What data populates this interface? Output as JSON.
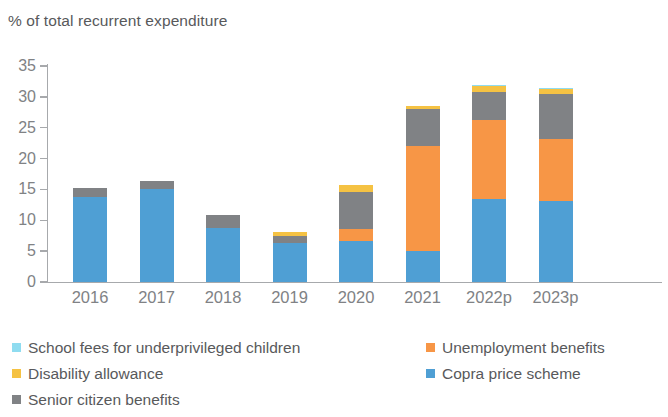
{
  "chart_data": {
    "type": "bar",
    "subtype": "stacked-vertical",
    "title": "% of total recurrent expenditure",
    "xlabel": "",
    "ylabel": "% of total recurrent expenditure",
    "ylim": [
      0,
      35
    ],
    "yticks": [
      0,
      5,
      10,
      15,
      20,
      25,
      30,
      35
    ],
    "ytick_labels": [
      "0",
      "5",
      "10",
      "15",
      "20",
      "25",
      "30",
      "35"
    ],
    "grid": false,
    "legend_position": "bottom",
    "categories": [
      "2016",
      "2017",
      "2018",
      "2019",
      "2020",
      "2021",
      "2022p",
      "2023p"
    ],
    "series": [
      {
        "name": "Copra price scheme",
        "color": "#4f9fd4",
        "values": [
          13.7,
          15.0,
          8.7,
          6.4,
          6.6,
          5.0,
          13.5,
          13.1
        ]
      },
      {
        "name": "Unemployment benefits",
        "color": "#f79646",
        "values": [
          0,
          0,
          0,
          0,
          2.0,
          17.1,
          12.8,
          10.0
        ]
      },
      {
        "name": "Senior citizen benefits",
        "color": "#808285",
        "values": [
          1.5,
          1.3,
          2.1,
          1.1,
          6.0,
          6.0,
          4.5,
          7.4
        ]
      },
      {
        "name": "Disability allowance",
        "color": "#f5c243",
        "values": [
          0,
          0,
          0,
          0.6,
          1.1,
          0.4,
          0.9,
          0.8
        ]
      },
      {
        "name": "School fees for underprivileged children",
        "color": "#8fdcf0",
        "values": [
          0,
          0,
          0,
          0,
          0.1,
          0.1,
          0.15,
          0.15
        ]
      }
    ],
    "totals": [
      15.2,
      16.3,
      10.8,
      8.1,
      15.8,
      28.6,
      31.85,
      31.45
    ]
  },
  "legend": {
    "items": [
      {
        "label": "School fees for underprivileged children",
        "color": "#8fdcf0"
      },
      {
        "label": "Disability allowance",
        "color": "#f5c243"
      },
      {
        "label": "Senior citizen benefits",
        "color": "#808285"
      },
      {
        "label": "Unemployment benefits",
        "color": "#f79646"
      },
      {
        "label": "Copra price scheme",
        "color": "#4f9fd4"
      }
    ]
  },
  "axis": {
    "title": "% of total recurrent expenditure",
    "axis_color": "#a7a9ac",
    "tick_text_color": "#808285"
  }
}
